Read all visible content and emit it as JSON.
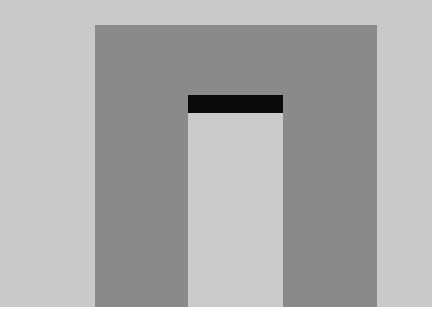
{
  "scene": {
    "description": "Abstract geometric composition: dark gray rectangle with light gray inner doorway capped by a black bar",
    "colors": {
      "background": "#c9c9c9",
      "outer_rect": "#8a8a8a",
      "inner_rect": "#cbcbcb",
      "bar": "#0a0a0a",
      "bottom_strip": "#ffffff"
    },
    "shapes": {
      "outer_rect": {
        "x": 95,
        "y": 25,
        "w": 282,
        "h": 282
      },
      "inner_rect": {
        "x": 188,
        "y": 113,
        "w": 95,
        "h": 194
      },
      "bar": {
        "x": 188,
        "y": 95,
        "w": 95,
        "h": 18
      }
    }
  }
}
